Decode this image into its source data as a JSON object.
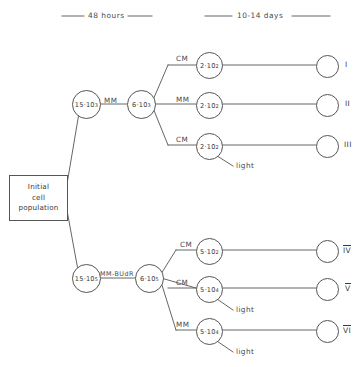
{
  "phases": [
    {
      "label": "48 hours"
    },
    {
      "label": "10-14 days"
    }
  ],
  "initial_box": {
    "line1": "Initial",
    "line2": "cell",
    "line3": "population"
  },
  "upper_branch": {
    "node_a": {
      "mantissa": "15·10",
      "exponent": "3"
    },
    "edge_label": "MM",
    "node_b": {
      "mantissa": "6·10",
      "exponent": "3"
    },
    "rows": [
      {
        "edge_label": "CM",
        "mantissa": "2·10",
        "exponent": "2",
        "roman": "I",
        "overline": false,
        "light": null
      },
      {
        "edge_label": "MM",
        "mantissa": "2·10",
        "exponent": "2",
        "roman": "II",
        "overline": false,
        "light": null
      },
      {
        "edge_label": "CM",
        "mantissa": "2·10",
        "exponent": "2",
        "roman": "III",
        "overline": false,
        "light": "light"
      }
    ]
  },
  "lower_branch": {
    "node_a": {
      "mantissa": "15·10",
      "exponent": "5"
    },
    "edge_label": "MM-BUdR",
    "node_b": {
      "mantissa": "6·10",
      "exponent": "5"
    },
    "rows": [
      {
        "edge_label": "CM",
        "mantissa": "5·10",
        "exponent": "2",
        "roman": "IV",
        "overline": true,
        "light": null
      },
      {
        "edge_label": "CM",
        "mantissa": "5·10",
        "exponent": "4",
        "roman": "V",
        "overline": true,
        "light": "light"
      },
      {
        "edge_label": "MM",
        "mantissa": "5·10",
        "exponent": "4",
        "roman": "VI",
        "overline": true,
        "light": "light"
      }
    ]
  },
  "colors": {
    "line": "#555555",
    "text": "#3a3a3a",
    "background": "#ffffff"
  }
}
